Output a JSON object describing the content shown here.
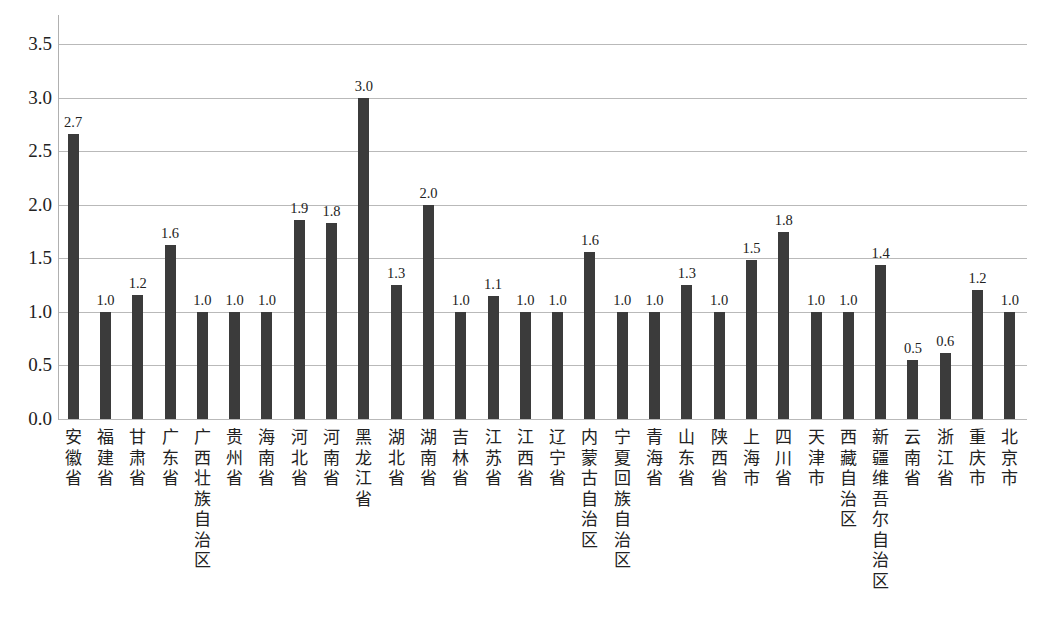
{
  "chart_data": {
    "type": "bar",
    "title": "",
    "xlabel": "",
    "ylabel": "",
    "ylim": [
      0,
      3.5
    ],
    "yticks": [
      "0.0",
      "0.5",
      "1.0",
      "1.5",
      "2.0",
      "2.5",
      "3.0",
      "3.5"
    ],
    "grid": true,
    "legend": null,
    "bar_color": "#3b3b3b",
    "grid_color": "#b9b9b9",
    "categories": [
      "安徽省",
      "福建省",
      "甘肃省",
      "广东省",
      "广西壮族自治区",
      "贵州省",
      "海南省",
      "河北省",
      "河南省",
      "黑龙江省",
      "湖北省",
      "湖南省",
      "吉林省",
      "江苏省",
      "江西省",
      "辽宁省",
      "内蒙古自治区",
      "宁夏回族自治区",
      "青海省",
      "山东省",
      "陕西省",
      "上海市",
      "四川省",
      "天津市",
      "西藏自治区",
      "新疆维吾尔自治区",
      "云南省",
      "浙江省",
      "重庆市",
      "北京市"
    ],
    "values": [
      2.66,
      1.0,
      1.16,
      1.62,
      1.0,
      1.0,
      1.0,
      1.86,
      1.83,
      3.0,
      1.25,
      2.0,
      1.0,
      1.15,
      1.0,
      1.0,
      1.56,
      1.0,
      1.0,
      1.25,
      1.0,
      1.48,
      1.75,
      1.0,
      1.0,
      1.44,
      0.55,
      0.62,
      1.2,
      1.0
    ],
    "value_labels": [
      "2.7",
      "1.0",
      "1.2",
      "1.6",
      "1.0",
      "1.0",
      "1.0",
      "1.9",
      "1.8",
      "3.0",
      "1.3",
      "2.0",
      "1.0",
      "1.1",
      "1.0",
      "1.0",
      "1.6",
      "1.0",
      "1.0",
      "1.3",
      "1.0",
      "1.5",
      "1.8",
      "1.0",
      "1.0",
      "1.4",
      "0.5",
      "0.6",
      "1.2",
      "1.0"
    ]
  }
}
